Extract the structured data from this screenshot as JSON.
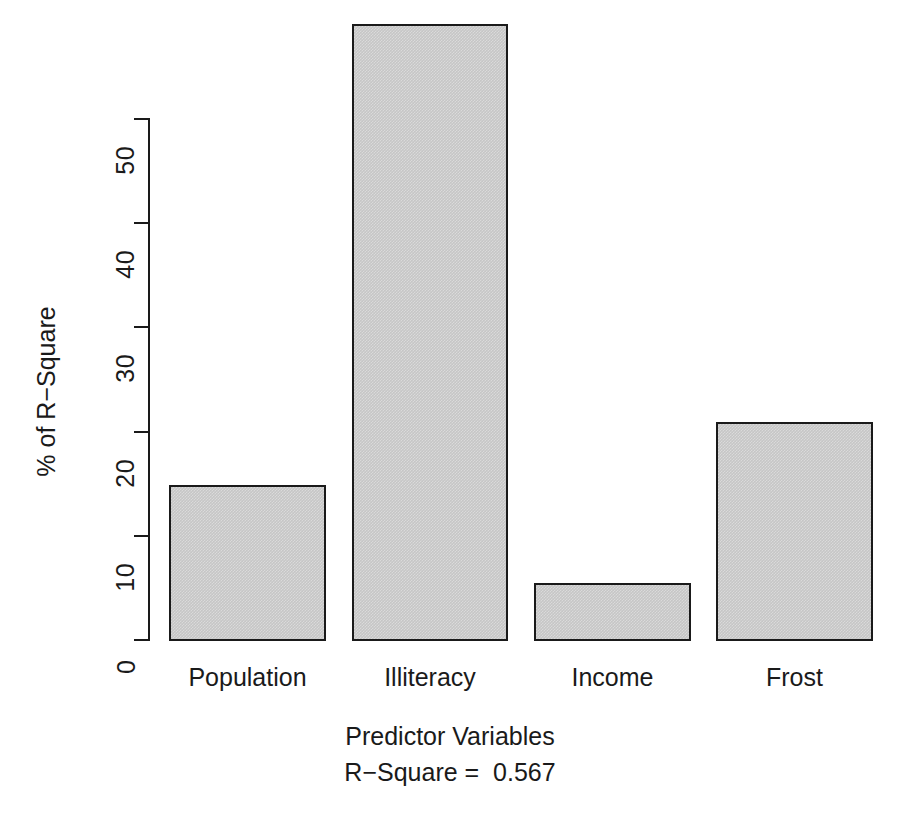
{
  "chart_data": {
    "type": "bar",
    "title": "",
    "subtitle": "",
    "categories": [
      "Population",
      "Illiteracy",
      "Income",
      "Frost"
    ],
    "values": [
      14.9,
      59.0,
      5.5,
      20.9
    ],
    "series": [
      {
        "name": "% of R-Square",
        "values": [
          14.9,
          59.0,
          5.5,
          20.9
        ]
      }
    ],
    "xlabel": "Predictor Variables",
    "ylabel": "% of R−Square",
    "ylim": [
      0,
      59.0
    ],
    "yticks": [
      0,
      10,
      20,
      30,
      40,
      50
    ],
    "ytick_labels": [
      "0",
      "10",
      "20",
      "30",
      "40",
      "50"
    ],
    "xticks": [
      "Population",
      "Illiteracy",
      "Income",
      "Frost"
    ],
    "grid": false,
    "legend": false,
    "legend_position": "none",
    "annotations": [
      {
        "name": "r-square-caption",
        "text": "R−Square =  0.567"
      }
    ],
    "bar_fill_color": "#c6c6c6",
    "bar_border_color": "#1a1a1a",
    "background_color": "#ffffff",
    "axis_color": "#1a1a1a"
  },
  "axis": {
    "y_title": "% of R−Square",
    "x_title": "Predictor Variables",
    "ticks": [
      {
        "label": "0",
        "value": 0
      },
      {
        "label": "10",
        "value": 10
      },
      {
        "label": "20",
        "value": 20
      },
      {
        "label": "30",
        "value": 30
      },
      {
        "label": "40",
        "value": 40
      },
      {
        "label": "50",
        "value": 50
      }
    ]
  },
  "bars": [
    {
      "label": "Population",
      "value": 14.9
    },
    {
      "label": "Illiteracy",
      "value": 59.0
    },
    {
      "label": "Income",
      "value": 5.5
    },
    {
      "label": "Frost",
      "value": 20.9
    }
  ],
  "caption": {
    "x_title": "Predictor Variables",
    "r_square": "R−Square =  0.567"
  }
}
